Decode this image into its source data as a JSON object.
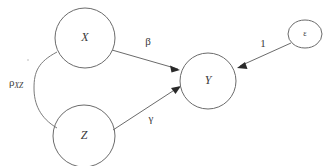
{
  "diagram": {
    "type": "path-diagram",
    "background_color": "#ffffff",
    "stroke_color": "#6b6b6b",
    "arrow_color": "#2a2a2a",
    "nodes": [
      {
        "id": "X",
        "label": "X",
        "shape": "circle",
        "cx": 85,
        "cy": 38,
        "r": 30
      },
      {
        "id": "Z",
        "label": "Z",
        "shape": "circle",
        "cx": 84,
        "cy": 136,
        "r": 31
      },
      {
        "id": "Y",
        "label": "Y",
        "shape": "circle",
        "cx": 208,
        "cy": 81,
        "r": 28
      },
      {
        "id": "E",
        "label": "ε",
        "shape": "ellipse",
        "cx": 305,
        "cy": 34,
        "rx": 17,
        "ry": 14
      }
    ],
    "edges": [
      {
        "id": "x-to-y",
        "from": "X",
        "to": "Y",
        "label": "β",
        "kind": "directed"
      },
      {
        "id": "z-to-y",
        "from": "Z",
        "to": "Y",
        "label": "γ",
        "kind": "directed"
      },
      {
        "id": "e-to-y",
        "from": "E",
        "to": "Y",
        "label": "1",
        "kind": "directed"
      },
      {
        "id": "x-z-correlation",
        "from": "X",
        "to": "Z",
        "label": "ρ",
        "sublabel": "XZ",
        "kind": "curve"
      }
    ],
    "labels": {
      "beta": "β",
      "gamma": "γ",
      "one": "1",
      "rho": "ρ",
      "rho_subscript": "XZ",
      "node_x": "X",
      "node_z": "Z",
      "node_y": "Y",
      "node_epsilon": "ε"
    }
  }
}
